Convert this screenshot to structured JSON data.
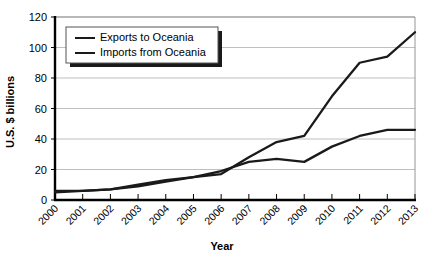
{
  "chart_data": {
    "type": "line",
    "title": "",
    "xlabel": "Year",
    "ylabel": "U.S. $ billions",
    "grid": true,
    "legend_position": "top-left-inside",
    "xlim": [
      2000,
      2013
    ],
    "ylim": [
      0,
      120
    ],
    "yticks": [
      0,
      20,
      40,
      60,
      80,
      100,
      120
    ],
    "categories": [
      "2000",
      "2001",
      "2002",
      "2003",
      "2004",
      "2005",
      "2006",
      "2007",
      "2008",
      "2009",
      "2010",
      "2011",
      "2012",
      "2013"
    ],
    "series": [
      {
        "name": "Exports to Oceania",
        "values": [
          5,
          6,
          7,
          9,
          12,
          15,
          19,
          25,
          27,
          25,
          35,
          42,
          46,
          46
        ]
      },
      {
        "name": "Imports from Oceania",
        "values": [
          6,
          6,
          7,
          10,
          13,
          15,
          17,
          28,
          38,
          42,
          68,
          90,
          94,
          110
        ]
      }
    ]
  },
  "axes": {
    "y_title": "U.S. $ billions",
    "x_title": "Year"
  },
  "legend": {
    "items": [
      {
        "label": "Exports to Oceania"
      },
      {
        "label": "Imports from Oceania"
      }
    ]
  },
  "colors": {
    "line": "#1a1a1a",
    "grid": "#b8b8b8",
    "axis": "#000000",
    "background": "#ffffff"
  }
}
